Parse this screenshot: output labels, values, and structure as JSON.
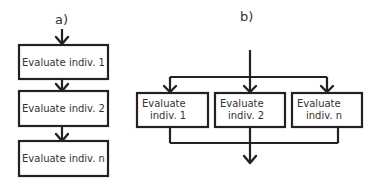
{
  "panel_a": {
    "label": "a)",
    "title": "Sequential evaluation",
    "boxes": [
      "Evaluate indiv. 1",
      "Evaluate indiv. 2",
      "Evaluate indiv. n"
    ]
  },
  "panel_b": {
    "label": "b)",
    "title": "Parallel evaluation",
    "boxes": [
      {
        "line1": "Evaluate",
        "line2": "indiv. 1"
      },
      {
        "line1": "Evaluate",
        "line2": "indiv. 2"
      },
      {
        "line1": "Evaluate",
        "line2": "indiv. n"
      }
    ]
  },
  "colors": {
    "stroke": "#222222",
    "text": "#333333",
    "background": "#ffffff"
  }
}
